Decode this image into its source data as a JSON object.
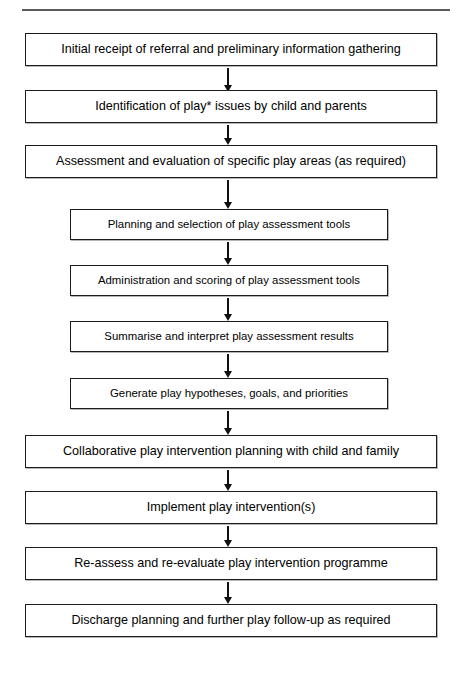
{
  "figure": {
    "type": "flowchart",
    "orientation": "top-to-bottom",
    "title_rule": "horizontal-divider",
    "footnote_marker": "*"
  },
  "colors": {
    "background": "#ffffff",
    "box_border": "#1c1c1c",
    "box_fill": "#ffffff",
    "arrow": "#111111",
    "rule": "#5a5a5a",
    "text": "#000000"
  },
  "nodes": [
    {
      "id": "n1",
      "label": "Initial receipt of referral and preliminary information gathering",
      "width": "wide"
    },
    {
      "id": "n2",
      "label": "Identification of play* issues by child and parents",
      "width": "wide"
    },
    {
      "id": "n3",
      "label": "Assessment and evaluation of specific play areas (as required)",
      "width": "wide"
    },
    {
      "id": "n4",
      "label": "Planning and selection of play assessment tools",
      "width": "narrow"
    },
    {
      "id": "n5",
      "label": "Administration and scoring of play assessment tools",
      "width": "narrow"
    },
    {
      "id": "n6",
      "label": "Summarise and interpret play assessment results",
      "width": "narrow"
    },
    {
      "id": "n7",
      "label": "Generate play hypotheses, goals, and priorities",
      "width": "narrow"
    },
    {
      "id": "n8",
      "label": "Collaborative play intervention planning with child and family",
      "width": "wide"
    },
    {
      "id": "n9",
      "label": "Implement play intervention(s)",
      "width": "wide"
    },
    {
      "id": "n10",
      "label": "Re-assess and re-evaluate play intervention programme",
      "width": "wide"
    },
    {
      "id": "n11",
      "label": "Discharge planning and further play follow-up as required",
      "width": "wide"
    }
  ],
  "edges": [
    {
      "from": "n1",
      "to": "n2",
      "icon": "down-arrow-icon"
    },
    {
      "from": "n2",
      "to": "n3",
      "icon": "down-arrow-icon"
    },
    {
      "from": "n3",
      "to": "n4",
      "icon": "down-arrow-icon"
    },
    {
      "from": "n4",
      "to": "n5",
      "icon": "down-arrow-icon"
    },
    {
      "from": "n5",
      "to": "n6",
      "icon": "down-arrow-icon"
    },
    {
      "from": "n6",
      "to": "n7",
      "icon": "down-arrow-icon"
    },
    {
      "from": "n7",
      "to": "n8",
      "icon": "down-arrow-icon"
    },
    {
      "from": "n8",
      "to": "n9",
      "icon": "down-arrow-icon"
    },
    {
      "from": "n9",
      "to": "n10",
      "icon": "down-arrow-icon"
    },
    {
      "from": "n10",
      "to": "n11",
      "icon": "down-arrow-icon"
    }
  ]
}
